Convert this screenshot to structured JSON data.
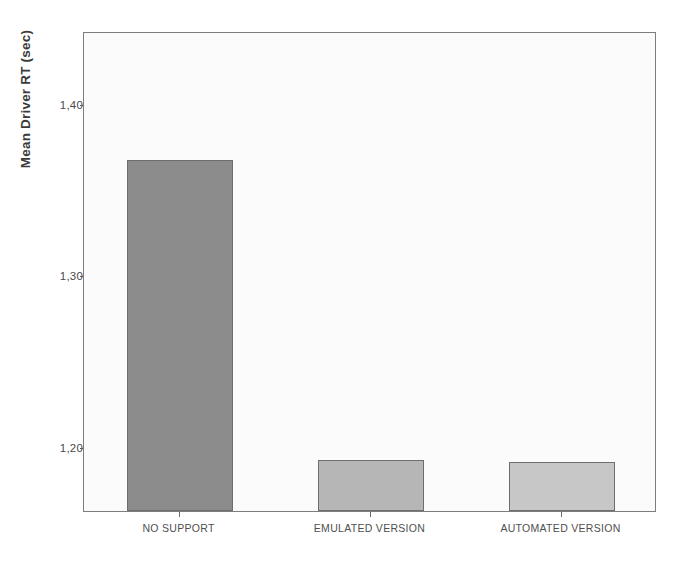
{
  "chart_data": {
    "type": "bar",
    "title": "",
    "subtitle": "",
    "xlabel": "",
    "ylabel": "Mean Driver RT (sec)",
    "categories": [
      "NO SUPPORT",
      "EMULATED VERSION",
      "AUTOMATED VERSION"
    ],
    "values": [
      1.367,
      1.192,
      1.191
    ],
    "series": [
      {
        "name": "Mean Driver RT (sec)",
        "values": [
          1.367,
          1.192,
          1.191
        ]
      }
    ],
    "ytick_labels": [
      "1,40",
      "1,30",
      "1,20"
    ],
    "ytick_values": [
      1.4,
      1.3,
      1.2
    ],
    "ylim": [
      1.1625,
      1.4425
    ],
    "grid": false,
    "legend": false,
    "legend_position": "none",
    "bar_colors": [
      "#8c8c8c",
      "#b6b6b6",
      "#c7c7c7"
    ],
    "bar_edge_color": "#6e6e6e",
    "plot_background": "#fbfbfb",
    "frame_color": "#7d7d7d",
    "axis_text_color": "#4a4a4a",
    "title_text_color": "#3a3a3a"
  }
}
